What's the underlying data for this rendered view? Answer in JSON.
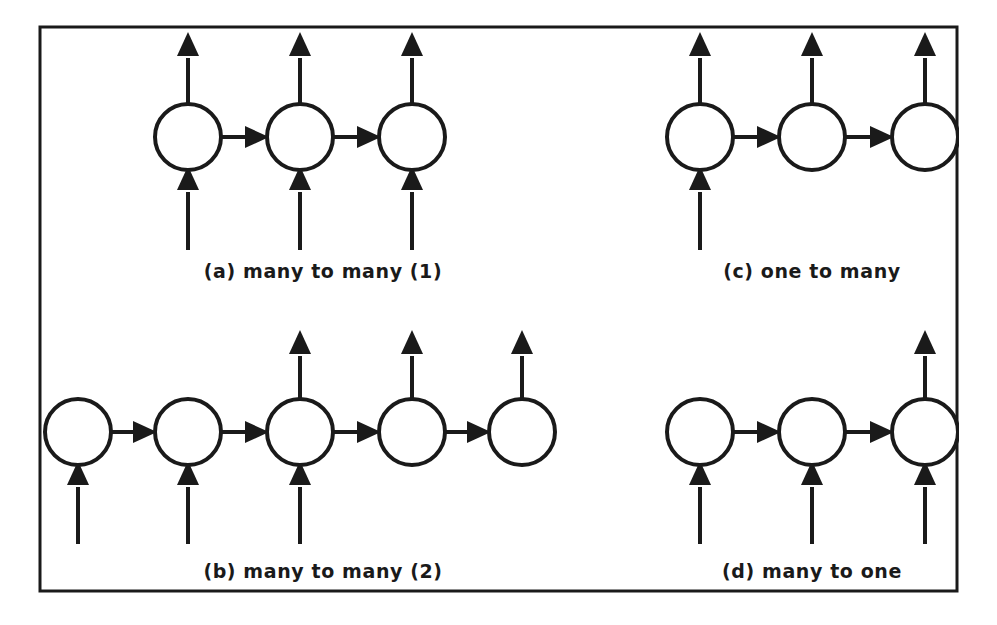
{
  "figure": {
    "background_color": "#ffffff",
    "stroke_color": "#1a1a1a",
    "node_fill_color": "#ffffff",
    "frame": {
      "x": 40,
      "y": 27,
      "width": 917,
      "height": 564,
      "stroke_width": 3
    },
    "node_radius": 33,
    "node_stroke_width": 4,
    "arrow_stroke_width": 4,
    "clip_edge_x": 957
  },
  "panels": [
    {
      "id": "a",
      "label": "(a) many to many (1)",
      "label_x": 323,
      "label_y": 278,
      "node_count": 3,
      "node_cy": 137,
      "node_cx": [
        188,
        300,
        412
      ],
      "recurrent_links": [
        [
          0,
          1
        ],
        [
          1,
          2
        ]
      ],
      "inputs": [
        0,
        1,
        2
      ],
      "outputs": [
        0,
        1,
        2
      ],
      "input_tail_y": 250,
      "output_tip_y": 32
    },
    {
      "id": "b",
      "label": "(b) many to many (2)",
      "label_x": 323,
      "label_y": 578,
      "node_count": 5,
      "node_cy": 432,
      "node_cx": [
        78,
        188,
        300,
        412,
        522
      ],
      "recurrent_links": [
        [
          0,
          1
        ],
        [
          1,
          2
        ],
        [
          2,
          3
        ],
        [
          3,
          4
        ]
      ],
      "inputs": [
        0,
        1,
        2
      ],
      "outputs": [
        2,
        3,
        4
      ],
      "input_tail_y": 544,
      "output_tip_y": 330
    },
    {
      "id": "c",
      "label": "(c) one to many",
      "label_x": 812,
      "label_y": 278,
      "node_count": 3,
      "node_cy": 137,
      "node_cx": [
        700,
        812,
        925
      ],
      "recurrent_links": [
        [
          0,
          1
        ],
        [
          1,
          2
        ]
      ],
      "inputs": [
        0
      ],
      "outputs": [
        0,
        1,
        2
      ],
      "input_tail_y": 250,
      "output_tip_y": 32
    },
    {
      "id": "d",
      "label": "(d) many to one",
      "label_x": 812,
      "label_y": 578,
      "node_count": 3,
      "node_cy": 432,
      "node_cx": [
        700,
        812,
        925
      ],
      "recurrent_links": [
        [
          0,
          1
        ],
        [
          1,
          2
        ]
      ],
      "inputs": [
        0,
        1,
        2
      ],
      "outputs": [
        2
      ],
      "input_tail_y": 544,
      "output_tip_y": 330
    }
  ]
}
